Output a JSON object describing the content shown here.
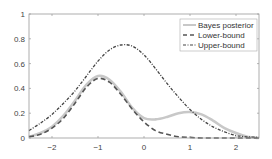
{
  "chart_data": {
    "type": "line",
    "title": "",
    "xlabel": "",
    "ylabel": "",
    "xlim": [
      -2.5,
      2.5
    ],
    "ylim": [
      0,
      1
    ],
    "grid": false,
    "legend_position": "upper right",
    "xticks": [
      -2,
      -1,
      0,
      1,
      2
    ],
    "xtick_labels": [
      "−2",
      "−1",
      "0",
      "1",
      "2"
    ],
    "yticks": [
      0,
      0.2,
      0.4,
      0.6,
      0.8,
      1
    ],
    "ytick_labels": [
      "0",
      "0.2",
      "0.4",
      "0.6",
      "0.8",
      "1"
    ],
    "x": [
      -2.5,
      -2.25,
      -2.0,
      -1.75,
      -1.5,
      -1.25,
      -1.0,
      -0.75,
      -0.5,
      -0.25,
      0.0,
      0.25,
      0.5,
      0.75,
      1.0,
      1.25,
      1.5,
      1.75,
      2.0,
      2.25,
      2.5
    ],
    "series": [
      {
        "name": "Bayes posterior",
        "style": "solid",
        "color": "#c8c8c8",
        "values": [
          0.01,
          0.04,
          0.09,
          0.18,
          0.3,
          0.43,
          0.5,
          0.47,
          0.37,
          0.24,
          0.16,
          0.15,
          0.17,
          0.2,
          0.21,
          0.19,
          0.14,
          0.08,
          0.04,
          0.01,
          0.0
        ]
      },
      {
        "name": "Lower-bound",
        "style": "dashed",
        "color": "#555555",
        "values": [
          0.01,
          0.03,
          0.08,
          0.16,
          0.28,
          0.41,
          0.48,
          0.45,
          0.35,
          0.23,
          0.13,
          0.06,
          0.03,
          0.01,
          0.005,
          0.0,
          0.0,
          0.0,
          0.0,
          0.0,
          0.0
        ]
      },
      {
        "name": "Upper-bound",
        "style": "dashdot",
        "color": "#444444",
        "values": [
          0.06,
          0.12,
          0.19,
          0.28,
          0.38,
          0.5,
          0.62,
          0.71,
          0.75,
          0.74,
          0.67,
          0.56,
          0.44,
          0.33,
          0.23,
          0.15,
          0.09,
          0.05,
          0.02,
          0.01,
          0.005
        ]
      }
    ]
  },
  "legend": {
    "items": [
      "Bayes posterior",
      "Lower-bound",
      "Upper-bound"
    ]
  }
}
